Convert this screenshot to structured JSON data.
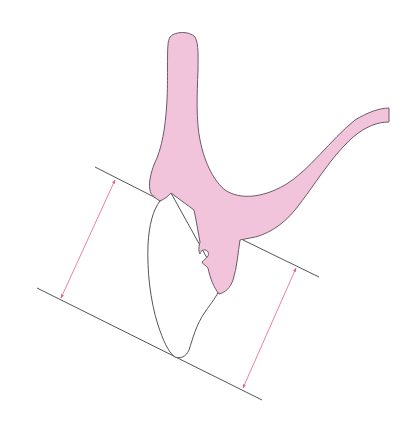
{
  "diagram": {
    "colors": {
      "bone_fill": "#f2c4dc",
      "outline": "#6e5a66",
      "reference_line": "#555555",
      "arrow": "#e0628e",
      "background": "#ffffff"
    },
    "elements": [
      {
        "name": "bone-structure",
        "description": "Pink Y-shaped bone/tissue with vertical lobe and right-curving arm"
      },
      {
        "name": "tooth-crown",
        "description": "White tooth outline below bone"
      },
      {
        "name": "reference-line-upper-left",
        "from": [
          95,
          167
        ],
        "to": [
          160,
          200
        ]
      },
      {
        "name": "reference-line-upper-right",
        "from": [
          243,
          240
        ],
        "to": [
          319,
          277
        ]
      },
      {
        "name": "reference-line-lower",
        "from": [
          37,
          288
        ],
        "to": [
          262,
          400
        ]
      },
      {
        "name": "measurement-arrow-left",
        "from": [
          115,
          180
        ],
        "to": [
          61,
          298
        ]
      },
      {
        "name": "measurement-arrow-right",
        "from": [
          296,
          268
        ],
        "to": [
          243,
          388
        ]
      }
    ]
  }
}
